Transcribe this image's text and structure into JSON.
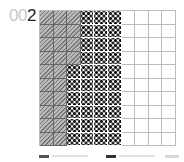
{
  "figure": {
    "label_prefix": "00",
    "label_number": "2"
  },
  "chart_data": {
    "type": "table",
    "subtype": "10x10 waffle / hundred-grid",
    "title": "002",
    "rows": 10,
    "columns": 10,
    "total_cells": 100,
    "categories": [
      "hatched",
      "dotted",
      "empty"
    ],
    "values": [
      25,
      35,
      40
    ],
    "row_composition": [
      {
        "rows": "1-4",
        "hatched": 3,
        "dotted": 3,
        "empty": 4
      },
      {
        "rows": "5-10",
        "hatched": 2,
        "dotted": 4,
        "empty": 4
      }
    ],
    "grid": true,
    "legend_position": "bottom",
    "legend_entries": [
      "hatched swatch",
      "dotted swatch",
      "box"
    ]
  },
  "colors": {
    "hatch": "#a9a9a9",
    "dot": "#111111",
    "gridline": "#bdbdbd"
  }
}
